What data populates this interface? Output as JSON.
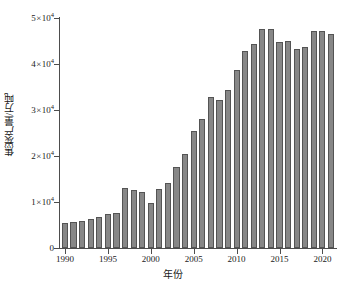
{
  "chart_data": {
    "type": "bar",
    "title": "",
    "xlabel": "年份",
    "ylabel": "焦炭产量/万吨",
    "categories": [
      1990,
      1991,
      1992,
      1993,
      1994,
      1995,
      1996,
      1997,
      1998,
      1999,
      2000,
      2001,
      2002,
      2003,
      2004,
      2005,
      2006,
      2007,
      2008,
      2009,
      2010,
      2011,
      2012,
      2013,
      2014,
      2015,
      2016,
      2017,
      2018,
      2019,
      2020,
      2021
    ],
    "values": [
      5400,
      5600,
      5900,
      6300,
      6700,
      7300,
      7600,
      13100,
      12600,
      12100,
      9700,
      12900,
      14200,
      17700,
      20500,
      25400,
      28000,
      32800,
      32200,
      34400,
      38800,
      42800,
      44300,
      47600,
      47600,
      44800,
      44900,
      43200,
      43800,
      47100,
      47100,
      46500
    ],
    "xlim": [
      1989.3,
      2021.7
    ],
    "ylim": [
      0,
      50000
    ],
    "yticks": [
      0,
      10000,
      20000,
      30000,
      40000,
      50000
    ],
    "ytick_labels": [
      "0",
      "1×10⁴",
      "2×10⁴",
      "3×10⁴",
      "4×10⁴",
      "5×10⁴"
    ],
    "ytick_mantissas": [
      "0",
      "1",
      "2",
      "3",
      "4",
      "5"
    ],
    "ytick_base": "10",
    "ytick_exponent": "4",
    "ytick_times": "×",
    "xticks": [
      1990,
      1995,
      2000,
      2005,
      2010,
      2015,
      2020
    ],
    "xtick_labels": [
      "1990",
      "1995",
      "2000",
      "2005",
      "2010",
      "2015",
      "2020"
    ],
    "grid": false,
    "legend": null,
    "bar_color": "#878787",
    "bar_edge_color": "#545454",
    "axis_color": "#4d4d4d",
    "background_color": "#ffffff"
  }
}
